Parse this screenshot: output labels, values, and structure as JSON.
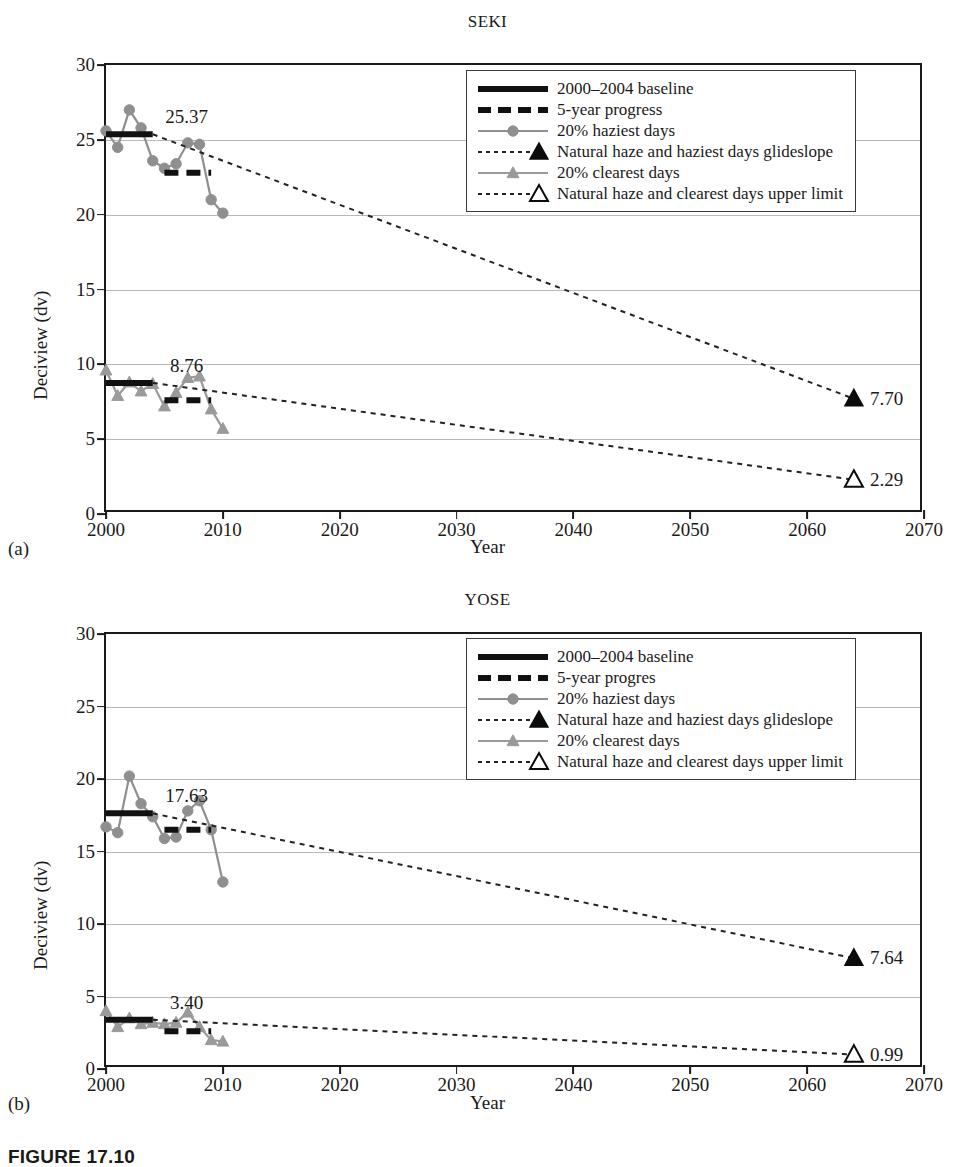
{
  "figure": {
    "caption": "FIGURE 17.10"
  },
  "axis": {
    "ylabel": "Deciview (dv)",
    "xlabel": "Year",
    "yticks": [
      0,
      5,
      10,
      15,
      20,
      25,
      30
    ],
    "xticks": [
      2000,
      2010,
      2020,
      2030,
      2040,
      2050,
      2060,
      2070
    ],
    "ylim": [
      0,
      30
    ],
    "xlim": [
      2000,
      2070
    ]
  },
  "colors": {
    "baseline": "#111111",
    "progress": "#111111",
    "haziest": "#8f8f8f",
    "clearest": "#9a9a9a",
    "glideslope": "#222222",
    "grid": "#b9b9b9",
    "frame": "#1a1a1a"
  },
  "panels": [
    {
      "letter": "(a)",
      "title": "SEKI",
      "legend": [
        {
          "key": "solid-thick-black",
          "label": "2000–2004 baseline"
        },
        {
          "key": "dashed-thick-black",
          "label": "5-year progress"
        },
        {
          "key": "line-circle-gray",
          "label": "20% haziest days"
        },
        {
          "key": "dotted-filled-triangle",
          "label": "Natural haze and haziest days glideslope"
        },
        {
          "key": "line-triangle-gray",
          "label": "20% clearest days"
        },
        {
          "key": "dotted-open-triangle",
          "label": "Natural haze and clearest days upper limit"
        }
      ],
      "chart_data": {
        "type": "line",
        "title": "SEKI",
        "xlabel": "Year",
        "ylabel": "Deciview (dv)",
        "xlim": [
          2000,
          2070
        ],
        "ylim": [
          0,
          30
        ],
        "grid": true,
        "legend_position": "upper-right",
        "series": [
          {
            "name": "20% haziest days",
            "type": "line-marker",
            "marker": "circle",
            "color": "#8f8f8f",
            "x": [
              2000,
              2001,
              2002,
              2003,
              2004,
              2005,
              2006,
              2007,
              2008,
              2009,
              2010
            ],
            "values": [
              25.6,
              24.5,
              27.0,
              25.8,
              23.6,
              23.1,
              23.4,
              24.8,
              24.7,
              21.0,
              20.1
            ]
          },
          {
            "name": "20% clearest days",
            "type": "line-marker",
            "marker": "triangle",
            "color": "#9a9a9a",
            "x": [
              2000,
              2001,
              2002,
              2003,
              2004,
              2005,
              2006,
              2007,
              2008,
              2009,
              2010
            ],
            "values": [
              9.6,
              7.9,
              8.8,
              8.2,
              8.7,
              7.2,
              8.1,
              9.1,
              9.2,
              7.0,
              5.7
            ]
          },
          {
            "name": "2000–2004 baseline (haziest)",
            "type": "hline",
            "color": "#111111",
            "x": [
              2000,
              2004
            ],
            "value": 25.37,
            "label": "25.37"
          },
          {
            "name": "5-year progress (haziest)",
            "type": "hline-dashed",
            "color": "#111111",
            "x": [
              2005,
              2009
            ],
            "value": 22.8
          },
          {
            "name": "2000–2004 baseline (clearest)",
            "type": "hline",
            "color": "#111111",
            "x": [
              2000,
              2004
            ],
            "value": 8.76,
            "label": "8.76"
          },
          {
            "name": "5-year progress (clearest)",
            "type": "hline-dashed",
            "color": "#111111",
            "x": [
              2005,
              2009
            ],
            "value": 7.6
          },
          {
            "name": "Natural haze and haziest days glideslope",
            "type": "dotted-line",
            "color": "#222222",
            "marker": "filled-triangle",
            "x": [
              2004,
              2064
            ],
            "values": [
              25.37,
              7.7
            ],
            "endpoint_label": "7.70"
          },
          {
            "name": "Natural haze and clearest days upper limit",
            "type": "dotted-line",
            "color": "#222222",
            "marker": "open-triangle",
            "x": [
              2004,
              2064
            ],
            "values": [
              8.76,
              2.29
            ],
            "endpoint_label": "2.29"
          }
        ]
      }
    },
    {
      "letter": "(b)",
      "title": "YOSE",
      "legend": [
        {
          "key": "solid-thick-black",
          "label": "2000–2004 baseline"
        },
        {
          "key": "dashed-thick-black",
          "label": "5-year progres"
        },
        {
          "key": "line-circle-gray",
          "label": "20% haziest days"
        },
        {
          "key": "dotted-filled-triangle",
          "label": "Natural haze and haziest days glideslope"
        },
        {
          "key": "line-triangle-gray",
          "label": "20% clearest days"
        },
        {
          "key": "dotted-open-triangle",
          "label": "Natural haze and clearest days upper limit"
        }
      ],
      "chart_data": {
        "type": "line",
        "title": "YOSE",
        "xlabel": "Year",
        "ylabel": "Deciview (dv)",
        "xlim": [
          2000,
          2070
        ],
        "ylim": [
          0,
          30
        ],
        "grid": true,
        "legend_position": "upper-right",
        "series": [
          {
            "name": "20% haziest days",
            "type": "line-marker",
            "marker": "circle",
            "color": "#8f8f8f",
            "x": [
              2000,
              2001,
              2002,
              2003,
              2004,
              2005,
              2006,
              2007,
              2008,
              2009,
              2010
            ],
            "values": [
              16.7,
              16.3,
              20.2,
              18.3,
              17.4,
              15.9,
              16.0,
              17.8,
              18.5,
              16.5,
              12.9
            ]
          },
          {
            "name": "20% clearest days",
            "type": "line-marker",
            "marker": "triangle",
            "color": "#9a9a9a",
            "x": [
              2000,
              2001,
              2002,
              2003,
              2004,
              2005,
              2006,
              2007,
              2008,
              2009,
              2010
            ],
            "values": [
              4.0,
              2.9,
              3.5,
              3.1,
              3.2,
              3.1,
              3.2,
              3.9,
              2.9,
              2.0,
              1.9
            ]
          },
          {
            "name": "2000–2004 baseline (haziest)",
            "type": "hline",
            "color": "#111111",
            "x": [
              2000,
              2004
            ],
            "value": 17.63,
            "label": "17.63"
          },
          {
            "name": "5-year progress (haziest)",
            "type": "hline-dashed",
            "color": "#111111",
            "x": [
              2005,
              2009
            ],
            "value": 16.5
          },
          {
            "name": "2000–2004 baseline (clearest)",
            "type": "hline",
            "color": "#111111",
            "x": [
              2000,
              2004
            ],
            "value": 3.4,
            "label": "3.40"
          },
          {
            "name": "5-year progress (clearest)",
            "type": "hline-dashed",
            "color": "#111111",
            "x": [
              2005,
              2009
            ],
            "value": 2.6
          },
          {
            "name": "Natural haze and haziest days glideslope",
            "type": "dotted-line",
            "color": "#222222",
            "marker": "filled-triangle",
            "x": [
              2004,
              2064
            ],
            "values": [
              17.63,
              7.64
            ],
            "endpoint_label": "7.64"
          },
          {
            "name": "Natural haze and clearest days upper limit",
            "type": "dotted-line",
            "color": "#222222",
            "marker": "open-triangle",
            "x": [
              2004,
              2064
            ],
            "values": [
              3.4,
              0.99
            ],
            "endpoint_label": "0.99"
          }
        ]
      }
    }
  ]
}
